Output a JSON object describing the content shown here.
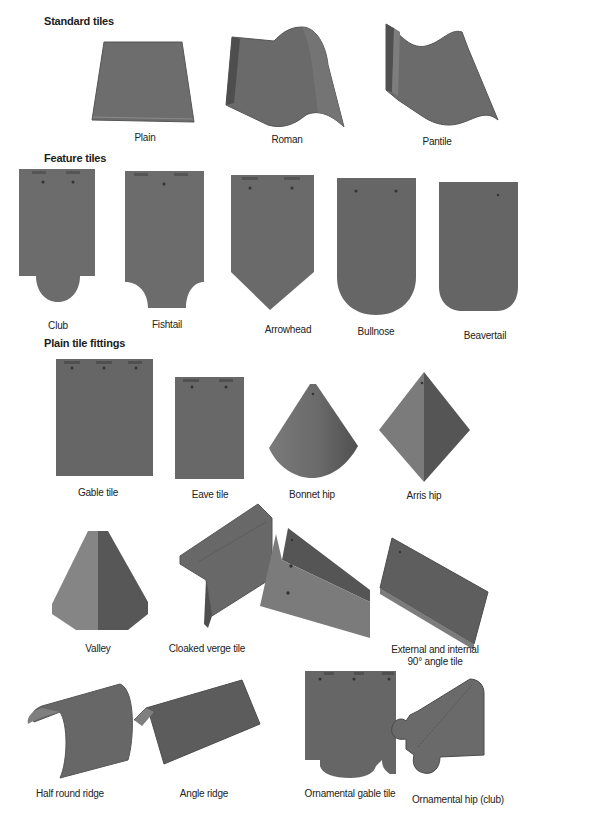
{
  "colors": {
    "background": "#ffffff",
    "tile": "#6e6e6e",
    "tile_dark": "#5a5a5a",
    "tile_light": "#8a8a8a",
    "text": "#222222"
  },
  "sections": [
    {
      "heading": "Standard tiles",
      "items": [
        {
          "label": "Plain",
          "shape": "trapezoid-flat"
        },
        {
          "label": "Roman",
          "shape": "roman-curve"
        },
        {
          "label": "Pantile",
          "shape": "s-curve"
        }
      ]
    },
    {
      "heading": "Feature tiles",
      "items": [
        {
          "label": "Club",
          "shape": "club"
        },
        {
          "label": "Fishtail",
          "shape": "fishtail"
        },
        {
          "label": "Arrowhead",
          "shape": "arrowhead"
        },
        {
          "label": "Bullnose",
          "shape": "bullnose"
        },
        {
          "label": "Beavertail",
          "shape": "beavertail"
        }
      ]
    },
    {
      "heading": "Plain tile fittings",
      "items": [
        {
          "label": "Gable tile",
          "shape": "rectangle"
        },
        {
          "label": "Eave tile",
          "shape": "rectangle-short"
        },
        {
          "label": "Bonnet hip",
          "shape": "cone-segment"
        },
        {
          "label": "Arris hip",
          "shape": "diamond"
        },
        {
          "label": "Valley",
          "shape": "valley"
        },
        {
          "label": "Cloaked verge tile",
          "shape": "cloaked-verge"
        },
        {
          "label": "External and internal",
          "label_line2": "90° angle tile",
          "shape": "angle-tile-external"
        },
        {
          "label": "",
          "shape": "angle-tile-internal"
        },
        {
          "label": "Half round ridge",
          "shape": "half-round-ridge"
        },
        {
          "label": "Angle ridge",
          "shape": "angle-ridge"
        },
        {
          "label": "Ornamental gable tile",
          "shape": "ornamental-gable"
        },
        {
          "label": "Ornamental hip (club)",
          "shape": "ornamental-hip"
        }
      ]
    }
  ]
}
